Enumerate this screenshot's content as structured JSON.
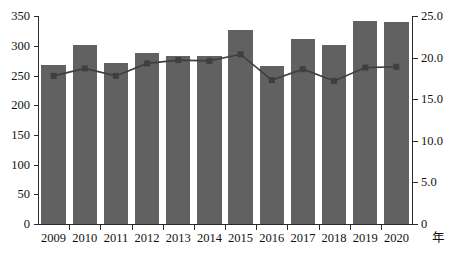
{
  "chart_data": {
    "type": "bar",
    "title": "",
    "xlabel": "年",
    "ylabel": "",
    "categories": [
      "2009",
      "2010",
      "2011",
      "2012",
      "2013",
      "2014",
      "2015",
      "2016",
      "2017",
      "2018",
      "2019",
      "2020"
    ],
    "grid": false,
    "legend": "none",
    "series": [
      {
        "name": "bars",
        "type": "bar",
        "axis": "left",
        "values": [
          268,
          301,
          271,
          288,
          283,
          283,
          326,
          266,
          311,
          302,
          341,
          340
        ]
      },
      {
        "name": "line",
        "type": "line",
        "axis": "right",
        "values": [
          17.8,
          18.7,
          17.8,
          19.3,
          19.7,
          19.6,
          20.4,
          17.3,
          18.6,
          17.2,
          18.8,
          18.9
        ]
      }
    ],
    "y_left": {
      "min": 0,
      "max": 350,
      "step": 50,
      "ticks": [
        "0",
        "50",
        "100",
        "150",
        "200",
        "250",
        "300",
        "350"
      ]
    },
    "y_right": {
      "min": 0,
      "max": 25,
      "step": 5,
      "ticks": [
        "0",
        "5.0",
        "10.0",
        "15.0",
        "20.0",
        "25.0"
      ]
    },
    "colors": {
      "bar": "#616161",
      "line": "#3f3f3f",
      "axis": "#2b2b2b",
      "background": "#ffffff"
    },
    "caption": ""
  }
}
